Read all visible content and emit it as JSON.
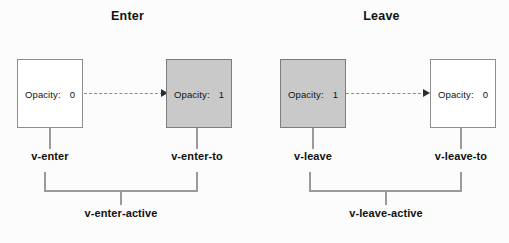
{
  "diagram": {
    "type": "transition-class-diagram",
    "background_color": "#fcfcfc",
    "line_color": "#9a9a9a",
    "filled_box_color": "#c9c9c9",
    "box_border_color": "#8e8e8e",
    "arrow_color": "#2e2e2e"
  },
  "panels": [
    {
      "id": "enter",
      "title": "Enter",
      "start_box": {
        "opacity_key": "Opacity:",
        "opacity_value": "0",
        "filled": false
      },
      "end_box": {
        "opacity_key": "Opacity:",
        "opacity_value": "1",
        "filled": true
      },
      "start_label": "v-enter",
      "end_label": "v-enter-to",
      "active_label": "v-enter-active"
    },
    {
      "id": "leave",
      "title": "Leave",
      "start_box": {
        "opacity_key": "Opacity:",
        "opacity_value": "1",
        "filled": true
      },
      "end_box": {
        "opacity_key": "Opacity:",
        "opacity_value": "0",
        "filled": false
      },
      "start_label": "v-leave",
      "end_label": "v-leave-to",
      "active_label": "v-leave-active"
    }
  ]
}
